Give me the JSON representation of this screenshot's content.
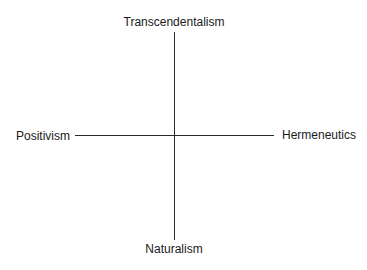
{
  "diagram": {
    "type": "two-axis quadrant diagram",
    "vertical_axis": {
      "top_label": "Transcendentalism",
      "bottom_label": "Naturalism"
    },
    "horizontal_axis": {
      "left_label": "Positivism",
      "right_label": "Hermeneutics"
    }
  }
}
